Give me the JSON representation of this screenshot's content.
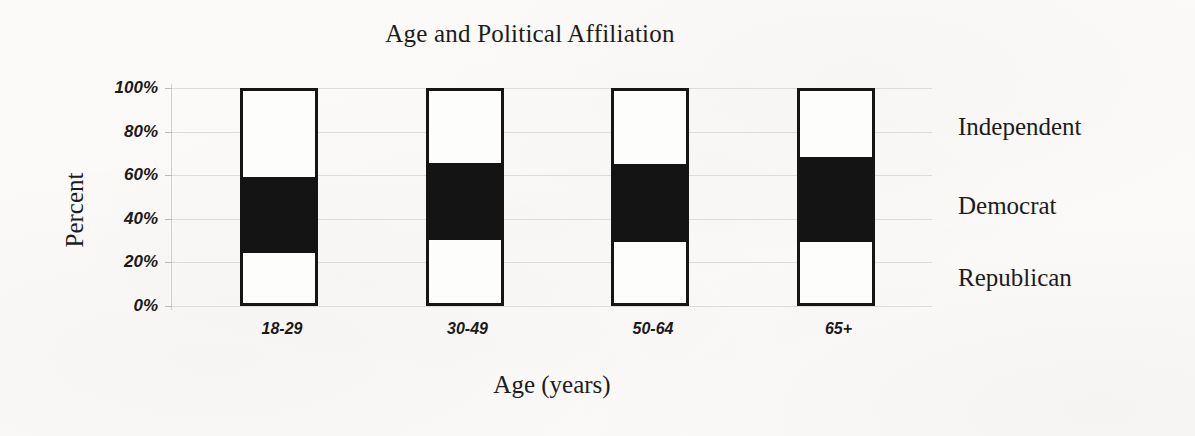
{
  "chart_data": {
    "type": "bar",
    "subtype": "stacked-bar-100-percent",
    "title": "Age and Political Affiliation",
    "xlabel": "Age (years)",
    "ylabel": "Percent",
    "categories": [
      "18-29",
      "30-49",
      "50-64",
      "65+"
    ],
    "series": [
      {
        "name": "Republican",
        "values": [
          23,
          29,
          28,
          28
        ],
        "color": "#fdfdfc"
      },
      {
        "name": "Democrat",
        "values": [
          35,
          35,
          36,
          39
        ],
        "color": "#141414"
      },
      {
        "name": "Independent",
        "values": [
          42,
          36,
          36,
          33
        ],
        "color": "#fdfdfc"
      }
    ],
    "cumulative_boundaries": [
      {
        "category": "18-29",
        "republican_top": 23,
        "democrat_top": 58
      },
      {
        "category": "30-49",
        "republican_top": 29,
        "democrat_top": 64
      },
      {
        "category": "50-64",
        "republican_top": 28,
        "democrat_top": 64
      },
      {
        "category": "65+",
        "republican_top": 28,
        "democrat_top": 67
      }
    ],
    "ylim": [
      0,
      100
    ],
    "yticks": [
      0,
      20,
      40,
      60,
      80,
      100
    ],
    "ytick_labels": [
      "0%",
      "20%",
      "40%",
      "60%",
      "80%",
      "100%"
    ],
    "grid": true,
    "legend_position": "right",
    "legend_entries": [
      "Independent",
      "Democrat",
      "Republican"
    ]
  },
  "legend_layout": [
    {
      "label": "Independent",
      "at_percent": 82
    },
    {
      "label": "Democrat",
      "at_percent": 46
    },
    {
      "label": "Republican",
      "at_percent": 13
    }
  ]
}
